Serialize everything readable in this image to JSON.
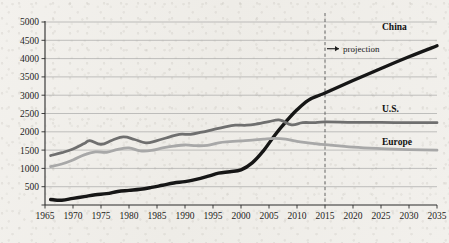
{
  "chart_data": {
    "type": "line",
    "title": "",
    "subtitle": "",
    "xlabel": "",
    "ylabel": "",
    "xlim": [
      1965,
      2035
    ],
    "ylim": [
      0,
      5000
    ],
    "grid": true,
    "legend_position": "right-inline",
    "y_ticks": [
      500,
      1000,
      1500,
      2000,
      2500,
      3000,
      3500,
      4000,
      4500,
      5000
    ],
    "y_tick_labels": [
      "500",
      "1000",
      "1500",
      "2000",
      "2500",
      "3000",
      "3500",
      "4000",
      "4500",
      "5000"
    ],
    "x_ticks": [
      1965,
      1970,
      1975,
      1980,
      1985,
      1990,
      1995,
      2000,
      2005,
      2010,
      2015,
      2020,
      2025,
      2030,
      2035
    ],
    "x_tick_labels": [
      "1965",
      "1970",
      "1975",
      "1980",
      "1985",
      "1990",
      "1995",
      "2000",
      "2005",
      "2010",
      "2015",
      "2020",
      "2025",
      "2030",
      "2035"
    ],
    "annotations": [
      {
        "text": "projection",
        "marker": "→",
        "at_x": 2015,
        "at_y": 4270
      }
    ],
    "projection_divider": {
      "x": 2015,
      "style": "dashed"
    },
    "series": [
      {
        "name": "China",
        "label": "China",
        "color": "#161616",
        "width": 3.4,
        "x": [
          1966,
          1968,
          1970,
          1972,
          1974,
          1976,
          1978,
          1980,
          1982,
          1984,
          1986,
          1988,
          1990,
          1992,
          1994,
          1996,
          1998,
          2000,
          2002,
          2004,
          2006,
          2008,
          2010,
          2012,
          2014,
          2015,
          2020,
          2025,
          2030,
          2035
        ],
        "values": [
          150,
          130,
          180,
          230,
          280,
          310,
          370,
          400,
          430,
          480,
          540,
          600,
          640,
          700,
          780,
          870,
          910,
          960,
          1150,
          1480,
          1900,
          2270,
          2600,
          2860,
          3000,
          3060,
          3400,
          3730,
          4050,
          4350
        ]
      },
      {
        "name": "U.S.",
        "label": "U.S.",
        "color": "#6f6f6f",
        "width": 2.8,
        "x": [
          1966,
          1968,
          1970,
          1972,
          1973,
          1975,
          1977,
          1979,
          1981,
          1983,
          1985,
          1987,
          1989,
          1991,
          1993,
          1995,
          1997,
          1999,
          2001,
          2003,
          2005,
          2007,
          2009,
          2011,
          2013,
          2015,
          2020,
          2025,
          2030,
          2035
        ],
        "values": [
          1350,
          1430,
          1530,
          1680,
          1760,
          1660,
          1770,
          1860,
          1790,
          1700,
          1760,
          1850,
          1930,
          1930,
          1990,
          2060,
          2130,
          2180,
          2180,
          2220,
          2280,
          2320,
          2190,
          2250,
          2250,
          2270,
          2260,
          2255,
          2250,
          2250
        ]
      },
      {
        "name": "Europe",
        "label": "Europe",
        "color": "#a8a8a8",
        "width": 2.8,
        "x": [
          1966,
          1968,
          1970,
          1972,
          1974,
          1976,
          1978,
          1980,
          1982,
          1984,
          1986,
          1988,
          1990,
          1992,
          1994,
          1996,
          1998,
          2000,
          2002,
          2004,
          2006,
          2008,
          2010,
          2012,
          2014,
          2015,
          2020,
          2025,
          2030,
          2035
        ],
        "values": [
          1050,
          1120,
          1230,
          1370,
          1450,
          1440,
          1520,
          1560,
          1480,
          1490,
          1560,
          1610,
          1640,
          1620,
          1630,
          1700,
          1730,
          1750,
          1770,
          1800,
          1820,
          1800,
          1740,
          1700,
          1660,
          1650,
          1580,
          1540,
          1515,
          1500
        ]
      }
    ]
  }
}
